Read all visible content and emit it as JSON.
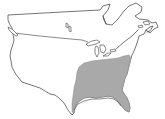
{
  "map": {
    "subject": "North America range map",
    "regions": [
      {
        "name": "Canada (southern)",
        "shaded": false
      },
      {
        "name": "Contiguous United States",
        "shaded": false
      },
      {
        "name": "Southeastern United States",
        "shaded": true
      }
    ],
    "colors": {
      "background": "#ffffff",
      "outline": "#3a3a3a",
      "shaded_range": "#a9a9a9",
      "shaded_range_edge": "#8c8c8c"
    }
  }
}
